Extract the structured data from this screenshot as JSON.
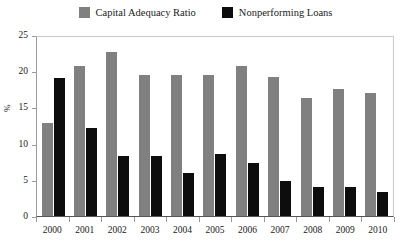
{
  "chart_data": {
    "type": "bar",
    "title": "",
    "subtitle": "",
    "xlabel": "",
    "ylabel": "%",
    "categories": [
      "2000",
      "2001",
      "2002",
      "2003",
      "2004",
      "2005",
      "2006",
      "2007",
      "2008",
      "2009",
      "2010"
    ],
    "series": [
      {
        "name": "Capital Adequacy Ratio",
        "color": "#808080",
        "values": [
          12.8,
          20.7,
          22.6,
          19.5,
          19.5,
          19.5,
          20.7,
          19.2,
          16.3,
          17.5,
          17.0
        ]
      },
      {
        "name": "Nonperforming Loans",
        "color": "#0d0d0d",
        "values": [
          19.0,
          12.2,
          8.3,
          8.3,
          6.0,
          8.5,
          7.3,
          4.9,
          4.0,
          4.0,
          3.3
        ]
      }
    ],
    "ylim": [
      0,
      25
    ],
    "ytick_values": [
      0,
      5,
      10,
      15,
      20,
      25
    ],
    "ytick_labels": [
      "0",
      "5",
      "10",
      "15",
      "20",
      "25"
    ],
    "grid": false,
    "legend_position": "top-center",
    "bar_group_style": "grouped"
  },
  "legend": {
    "entries": [
      {
        "label": "Capital Adequacy Ratio",
        "color": "#808080"
      },
      {
        "label": "Nonperforming Loans",
        "color": "#0d0d0d"
      }
    ]
  },
  "axes": {
    "y_label": "%",
    "y_ticks": [
      "25",
      "20",
      "15",
      "10",
      "5",
      "0"
    ],
    "x_ticks": [
      "2000",
      "2001",
      "2002",
      "2003",
      "2004",
      "2005",
      "2006",
      "2007",
      "2008",
      "2009",
      "2010"
    ]
  }
}
